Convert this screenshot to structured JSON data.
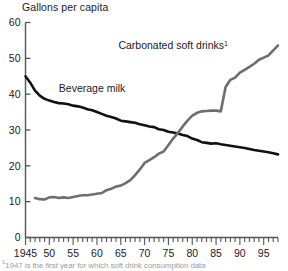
{
  "axis_title": "Gallons per capita",
  "footnote_marker": "1",
  "footnote_text": "1947 is the first year for which soft drink consumption data",
  "labels": {
    "milk": "Beverage milk",
    "soft_drinks": "Carbonated soft drinks",
    "soft_drinks_sup": "1"
  },
  "colors": {
    "milk_line": "#111111",
    "soft_drinks_line": "#6e6e6e",
    "axis": "#555555",
    "text": "#1a1a1a"
  },
  "chart_data": {
    "type": "line",
    "title": "",
    "xlabel": "",
    "ylabel": "Gallons per capita",
    "xlim": [
      1945,
      1998
    ],
    "ylim": [
      0,
      60
    ],
    "yticks": [
      0,
      10,
      20,
      30,
      40,
      50,
      60
    ],
    "xticks": [
      1945,
      1950,
      1955,
      1960,
      1965,
      1970,
      1975,
      1980,
      1985,
      1990,
      1995
    ],
    "xtick_labels": [
      "1945",
      "50",
      "55",
      "60",
      "65",
      "70",
      "75",
      "80",
      "85",
      "90",
      "95"
    ],
    "minor_xtick_interval": 1,
    "grid": false,
    "legend": "inline-annotation",
    "annotations": [
      {
        "text": "Beverage milk",
        "x": 1952,
        "y": 40.5
      },
      {
        "text": "Carbonated soft drinks1",
        "x": 1976,
        "y": 52.5
      }
    ],
    "series": [
      {
        "name": "Beverage milk",
        "color": "#111111",
        "x": [
          1945,
          1946,
          1947,
          1948,
          1949,
          1950,
          1951,
          1952,
          1953,
          1954,
          1955,
          1956,
          1957,
          1958,
          1959,
          1960,
          1961,
          1962,
          1963,
          1964,
          1965,
          1966,
          1967,
          1968,
          1969,
          1970,
          1971,
          1972,
          1973,
          1974,
          1975,
          1976,
          1977,
          1978,
          1979,
          1980,
          1981,
          1982,
          1983,
          1984,
          1985,
          1986,
          1987,
          1988,
          1989,
          1990,
          1991,
          1992,
          1993,
          1994,
          1995,
          1996,
          1997,
          1998
        ],
        "values": [
          45.0,
          43.2,
          41.0,
          39.6,
          38.7,
          38.2,
          37.8,
          37.5,
          37.4,
          37.2,
          36.8,
          36.6,
          36.3,
          35.8,
          35.5,
          35.0,
          34.5,
          34.0,
          33.6,
          33.2,
          32.6,
          32.4,
          32.2,
          32.0,
          31.6,
          31.3,
          31.0,
          30.8,
          30.2,
          30.0,
          29.5,
          29.3,
          29.0,
          28.6,
          28.3,
          27.6,
          27.2,
          26.6,
          26.4,
          26.2,
          26.3,
          26.0,
          25.8,
          25.6,
          25.4,
          25.2,
          25.0,
          24.7,
          24.4,
          24.2,
          24.0,
          23.8,
          23.5,
          23.2
        ]
      },
      {
        "name": "Carbonated soft drinks",
        "color": "#6e6e6e",
        "x": [
          1947,
          1948,
          1949,
          1950,
          1951,
          1952,
          1953,
          1954,
          1955,
          1956,
          1957,
          1958,
          1959,
          1960,
          1961,
          1962,
          1963,
          1964,
          1965,
          1966,
          1967,
          1968,
          1969,
          1970,
          1971,
          1972,
          1973,
          1974,
          1975,
          1976,
          1977,
          1978,
          1979,
          1980,
          1981,
          1982,
          1983,
          1984,
          1985,
          1986,
          1987,
          1988,
          1989,
          1990,
          1991,
          1992,
          1993,
          1994,
          1995,
          1996,
          1997,
          1998
        ],
        "values": [
          11.0,
          10.7,
          10.6,
          11.2,
          11.3,
          11.0,
          11.2,
          11.0,
          11.3,
          11.6,
          11.8,
          11.8,
          12.0,
          12.2,
          12.4,
          13.2,
          13.6,
          14.2,
          14.5,
          15.2,
          16.0,
          17.4,
          19.0,
          20.8,
          21.6,
          22.4,
          23.4,
          24.0,
          25.8,
          27.6,
          29.2,
          31.0,
          32.6,
          34.0,
          34.8,
          35.2,
          35.3,
          35.4,
          35.4,
          35.2,
          42.0,
          44.0,
          44.6,
          46.0,
          46.8,
          47.6,
          48.5,
          49.6,
          50.2,
          50.8,
          52.2,
          53.6
        ]
      }
    ]
  }
}
